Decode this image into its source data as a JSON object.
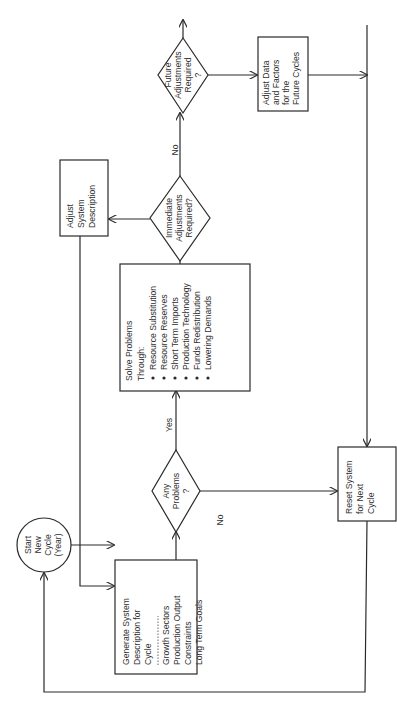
{
  "diagram": {
    "type": "flowchart",
    "orientation": "rotated-90-ccw",
    "nodes": {
      "start": {
        "shape": "circle",
        "lines": [
          "Start",
          "New",
          "Cycle",
          "(Year)"
        ]
      },
      "generate": {
        "shape": "box",
        "title_lines": [
          "Generate System",
          "Description for",
          "Cycle"
        ],
        "separator": "-----------",
        "items": [
          "Growth Sectors",
          "Production Output",
          "Constraints",
          "Long Term Goals"
        ]
      },
      "any_problems": {
        "shape": "diamond",
        "lines": [
          "Any",
          "Problems",
          "?"
        ]
      },
      "solve": {
        "shape": "box",
        "title_lines": [
          "Solve Problems",
          "Through:"
        ],
        "bullets": [
          "Resource Substitution",
          "Resource Reserves",
          "Short Term Imports",
          "Production Technology",
          "Funds Redistribution",
          "Lowering Demands"
        ]
      },
      "immediate": {
        "shape": "diamond",
        "lines": [
          "Immediate",
          "Adjustments",
          "Required?"
        ]
      },
      "adjust_system": {
        "shape": "box",
        "lines": [
          "Adjust",
          "System",
          "Description"
        ]
      },
      "future": {
        "shape": "diamond",
        "lines": [
          "Future",
          "Adjustments",
          "Required",
          "?"
        ]
      },
      "adjust_data": {
        "shape": "box",
        "lines": [
          "Adjust Data",
          "and Factors",
          "for the",
          "Future Cycles"
        ]
      },
      "reset": {
        "shape": "box",
        "lines": [
          "Reset System",
          "for Next",
          "Cycle"
        ]
      }
    },
    "edge_labels": {
      "any_yes": "Yes",
      "any_no": "No",
      "immediate_no": "No"
    },
    "edges": [
      {
        "from": "start",
        "to": "generate"
      },
      {
        "from": "generate",
        "to": "any_problems"
      },
      {
        "from": "any_problems",
        "to": "solve",
        "label": "Yes"
      },
      {
        "from": "any_problems",
        "to": "reset",
        "label": "No"
      },
      {
        "from": "solve",
        "to": "immediate"
      },
      {
        "from": "immediate",
        "to": "adjust_system",
        "label": "Yes (implied)"
      },
      {
        "from": "immediate",
        "to": "future",
        "label": "No"
      },
      {
        "from": "adjust_system",
        "to": "generate"
      },
      {
        "from": "future",
        "to": "adjust_data"
      },
      {
        "from": "adjust_data",
        "to": "right-bus"
      },
      {
        "from": "right-bus",
        "to": "reset"
      },
      {
        "from": "reset",
        "to": "start"
      }
    ]
  }
}
